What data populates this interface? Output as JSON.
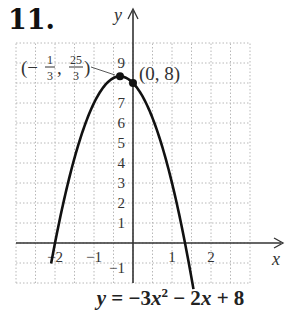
{
  "problem": {
    "number": "11."
  },
  "chart_data": {
    "type": "line",
    "title": "",
    "equation": "y = −3x² − 2x + 8",
    "function": {
      "a": -3,
      "b": -2,
      "c": 8
    },
    "xlabel": "x",
    "ylabel": "y",
    "xlim": [
      -3,
      3
    ],
    "ylim": [
      -2,
      10
    ],
    "grid": true,
    "grid_style": "dotted",
    "x_grid_step": 0.5,
    "y_grid_step": 1,
    "x_ticks": [
      {
        "value": -2,
        "label": "−2"
      },
      {
        "value": -1,
        "label": "−1"
      },
      {
        "value": 1,
        "label": "1"
      },
      {
        "value": 2,
        "label": "2"
      }
    ],
    "y_ticks": [
      {
        "value": -1,
        "label": "−1"
      },
      {
        "value": 1,
        "label": "1"
      },
      {
        "value": 2,
        "label": "2"
      },
      {
        "value": 3,
        "label": "3"
      },
      {
        "value": 4,
        "label": "4"
      },
      {
        "value": 5,
        "label": "5"
      },
      {
        "value": 6,
        "label": "6"
      },
      {
        "value": 7,
        "label": "7"
      },
      {
        "value": 9,
        "label": "9"
      }
    ],
    "curve_x_range": [
      -2.1,
      1.55
    ],
    "points": [
      {
        "x": -0.3333,
        "y": 8.3333,
        "label_num": [
          "1",
          "25"
        ],
        "label_den": [
          "3",
          "3"
        ],
        "label": "(−1/3, 25/3)",
        "role": "vertex"
      },
      {
        "x": 0,
        "y": 8,
        "label": "(0, 8)",
        "role": "y-intercept"
      }
    ],
    "colors": {
      "curve": "#111111",
      "axis": "#333333",
      "grid": "#b8b8b8",
      "text": "#333333"
    }
  },
  "caption": {
    "equation_parts": {
      "y": "y",
      "eq": " = −3",
      "x1": "x",
      "sup": "2",
      "rest1": " − 2",
      "x2": "x",
      "rest2": " + 8"
    }
  }
}
